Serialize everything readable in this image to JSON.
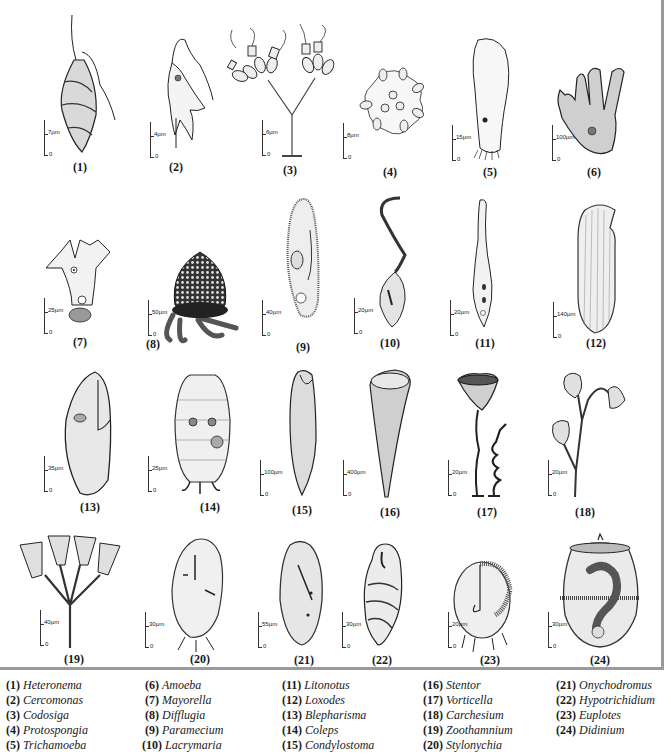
{
  "figure": {
    "panels": [
      {
        "num": "(1)",
        "scale": "7µm"
      },
      {
        "num": "(2)",
        "scale": "4µm"
      },
      {
        "num": "(3)",
        "scale": "6µm"
      },
      {
        "num": "(4)",
        "scale": "8µm"
      },
      {
        "num": "(5)",
        "scale": "15µm"
      },
      {
        "num": "(6)",
        "scale": "100µm"
      },
      {
        "num": "(7)",
        "scale": "25µm"
      },
      {
        "num": "(8)",
        "scale": "50µm"
      },
      {
        "num": "(9)",
        "scale": "40µm"
      },
      {
        "num": "(10)",
        "scale": "20µm"
      },
      {
        "num": "(11)",
        "scale": "20µm"
      },
      {
        "num": "(12)",
        "scale": "140µm"
      },
      {
        "num": "(13)",
        "scale": "35µm"
      },
      {
        "num": "(14)",
        "scale": "25µm"
      },
      {
        "num": "(15)",
        "scale": "100µm"
      },
      {
        "num": "(16)",
        "scale": "400µm"
      },
      {
        "num": "(17)",
        "scale": "20µm"
      },
      {
        "num": "(18)",
        "scale": "20µm"
      },
      {
        "num": "(19)",
        "scale": "40µm"
      },
      {
        "num": "(20)",
        "scale": "30µm"
      },
      {
        "num": "(21)",
        "scale": "55µm"
      },
      {
        "num": "(22)",
        "scale": "30µm"
      },
      {
        "num": "(23)",
        "scale": "20µm"
      },
      {
        "num": "(24)",
        "scale": "30µm"
      }
    ],
    "zero_label": "0"
  },
  "legend": {
    "columns": [
      [
        {
          "num": "(1)",
          "name": "Heteronema"
        },
        {
          "num": "(2)",
          "name": "Cercomonas"
        },
        {
          "num": "(3)",
          "name": "Codosiga"
        },
        {
          "num": "(4)",
          "name": "Protospongia"
        },
        {
          "num": "(5)",
          "name": "Trichamoeba"
        }
      ],
      [
        {
          "num": "(6)",
          "name": "Amoeba"
        },
        {
          "num": "(7)",
          "name": "Mayorella"
        },
        {
          "num": "(8)",
          "name": "Difflugia"
        },
        {
          "num": "(9)",
          "name": "Paramecium"
        },
        {
          "num": "(10)",
          "name": "Lacrymaria"
        }
      ],
      [
        {
          "num": "(11)",
          "name": "Litonotus"
        },
        {
          "num": "(12)",
          "name": "Loxodes"
        },
        {
          "num": "(13)",
          "name": "Blepharisma"
        },
        {
          "num": "(14)",
          "name": "Coleps"
        },
        {
          "num": "(15)",
          "name": "Condylostoma"
        }
      ],
      [
        {
          "num": "(16)",
          "name": "Stentor"
        },
        {
          "num": "(17)",
          "name": "Vorticella"
        },
        {
          "num": "(18)",
          "name": "Carchesium"
        },
        {
          "num": "(19)",
          "name": "Zoothamnium"
        },
        {
          "num": "(20)",
          "name": "Stylonychia"
        }
      ],
      [
        {
          "num": "(21)",
          "name": "Onychodromus"
        },
        {
          "num": "(22)",
          "name": "Hypotrichidium"
        },
        {
          "num": "(23)",
          "name": "Euplotes"
        },
        {
          "num": "(24)",
          "name": "Didinium"
        }
      ]
    ]
  }
}
